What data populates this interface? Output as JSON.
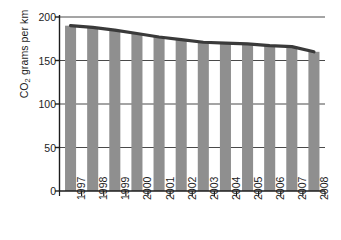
{
  "chart_data": {
    "type": "bar",
    "title": "",
    "xlabel": "",
    "ylabel": "CO2 grams per km",
    "ylabel_parts": {
      "pre": "CO",
      "sub": "2",
      "post": " grams per km"
    },
    "categories": [
      "1997",
      "1998",
      "1999",
      "2000",
      "2001",
      "2002",
      "2003",
      "2004",
      "2005",
      "2006",
      "2007",
      "2008"
    ],
    "values": [
      190,
      188,
      185,
      181,
      177,
      174,
      171,
      170,
      169,
      167,
      166,
      160
    ],
    "series": [
      {
        "name": "CO2 grams per km",
        "type": "bar",
        "values": [
          190,
          188,
          185,
          181,
          177,
          174,
          171,
          170,
          169,
          167,
          166,
          160
        ],
        "color": "#8f8f8f"
      },
      {
        "name": "trend-line",
        "type": "line",
        "values": [
          190,
          188,
          185,
          181,
          177,
          174,
          171,
          170,
          169,
          167,
          166,
          160
        ],
        "color": "#3a3a3a"
      }
    ],
    "ylim": [
      0,
      200
    ],
    "yticks": [
      0,
      50,
      100,
      150,
      200
    ],
    "ytick_labels": [
      "0",
      "50",
      "100",
      "150",
      "200"
    ],
    "grid": true,
    "grid_axis": "y",
    "legend": false,
    "legend_position": "none"
  },
  "axes": {
    "y_axis_name": "y-axis",
    "x_axis_name": "x-axis"
  },
  "colors": {
    "bar": "#8f8f8f",
    "line": "#3a3a3a",
    "axis": "#1d1d1d",
    "grid": "#4a4a4a",
    "background": "#ffffff"
  }
}
